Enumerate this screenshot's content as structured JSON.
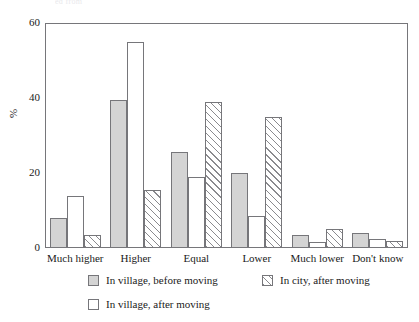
{
  "top_clipped_text": "ed from",
  "chart_data": {
    "type": "bar",
    "title": "",
    "subtitle": "",
    "xlabel": "",
    "ylabel": "%",
    "ylim": [
      0,
      60
    ],
    "yticks": [
      0,
      20,
      40,
      60
    ],
    "ytick_labels": [
      "0",
      "20",
      "40",
      "60"
    ],
    "grid": false,
    "legend_position": "bottom",
    "categories": [
      "Much higher",
      "Higher",
      "Equal",
      "Lower",
      "Much lower",
      "Don't know"
    ],
    "series": [
      {
        "name": "In village, before moving",
        "style": "solid-gray",
        "color": "#d4d4d4",
        "values": [
          8,
          39.5,
          25.5,
          20,
          3.5,
          4
        ]
      },
      {
        "name": "In village, after moving",
        "style": "open-white",
        "color": "#ffffff",
        "values": [
          14,
          55,
          19,
          8.5,
          1.5,
          2.5
        ]
      },
      {
        "name": "In city, after moving",
        "style": "diagonal-hatch",
        "color": "#ffffff",
        "values": [
          3.5,
          15.5,
          39,
          35,
          5,
          2
        ]
      }
    ]
  },
  "legend": {
    "items": [
      {
        "label": "In village, before moving",
        "swatch": "solid"
      },
      {
        "label": "In city, after moving",
        "swatch": "hatch"
      },
      {
        "label": "In village, after moving",
        "swatch": "open"
      }
    ]
  },
  "colors": {
    "axis": "#76767a",
    "text": "#1a1a1a",
    "bar_solid": "#d4d4d4",
    "bar_open": "#ffffff",
    "bar_hatch_line": "#8a8a8e",
    "background": "#ffffff"
  }
}
